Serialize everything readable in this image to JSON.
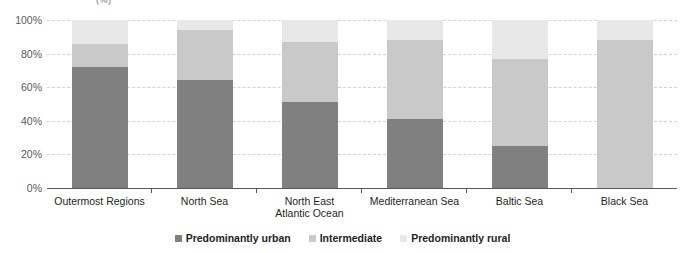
{
  "chart_data": {
    "type": "bar",
    "subtype": "stacked-100-percent",
    "title": "",
    "axis_unit_label": "(%)",
    "xlabel": "",
    "ylabel": "",
    "ylim": [
      0,
      100
    ],
    "ytick_values": [
      100,
      80,
      60,
      40,
      20,
      0
    ],
    "ytick_labels": [
      "100%",
      "80%",
      "60%",
      "40%",
      "20%",
      "0%"
    ],
    "grid": true,
    "legend_position": "bottom-center",
    "categories": [
      "Outermost Regions",
      "North Sea",
      "North East Atlantic Ocean",
      "Mediterranean Sea",
      "Baltic Sea",
      "Black Sea"
    ],
    "category_lines": [
      [
        "Outermost Regions"
      ],
      [
        "North Sea"
      ],
      [
        "North East",
        "Atlantic Ocean"
      ],
      [
        "Mediterranean Sea"
      ],
      [
        "Baltic Sea"
      ],
      [
        "Black Sea"
      ]
    ],
    "series": [
      {
        "name": "Predominantly urban",
        "color": "#808080",
        "values": [
          72,
          64,
          51,
          41,
          25,
          0
        ]
      },
      {
        "name": "Intermediate",
        "color": "#c9c9c9",
        "values": [
          14,
          30,
          36,
          47,
          52,
          88
        ]
      },
      {
        "name": "Predominantly rural",
        "color": "#e8e8e8",
        "values": [
          14,
          6,
          13,
          12,
          23,
          12
        ]
      }
    ]
  },
  "colors": {
    "urban": "#808080",
    "intermediate": "#c9c9c9",
    "rural": "#e8e8e8",
    "axis": "#58595b",
    "gridline": "#d2d2d2",
    "text": "#231f20"
  }
}
